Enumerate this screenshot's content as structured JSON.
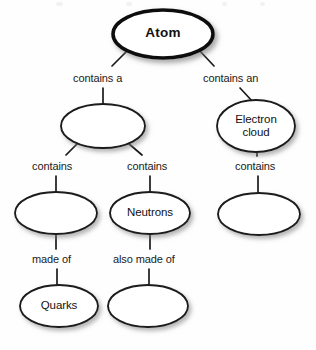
{
  "diagram": {
    "type": "concept-map",
    "title_node": "Atom",
    "background_color": "#fefefe",
    "stroke_color": "#1a1a1a",
    "node_fill": "#ffffff",
    "nodes": [
      {
        "id": "atom",
        "label": "Atom",
        "cx": 163,
        "cy": 34,
        "rx": 50,
        "ry": 24,
        "bold": true,
        "thick": true
      },
      {
        "id": "nucleus",
        "label": "",
        "cx": 103,
        "cy": 126,
        "rx": 42,
        "ry": 22,
        "bold": false,
        "thick": false
      },
      {
        "id": "electroncloud",
        "label": "Electron\ncloud",
        "cx": 256,
        "cy": 126,
        "rx": 39,
        "ry": 26,
        "bold": false,
        "thick": false
      },
      {
        "id": "protons",
        "label": "",
        "cx": 56,
        "cy": 213,
        "rx": 41,
        "ry": 21,
        "bold": false,
        "thick": false
      },
      {
        "id": "neutrons",
        "label": "Neutrons",
        "cx": 150,
        "cy": 213,
        "rx": 40,
        "ry": 21,
        "bold": false,
        "thick": false
      },
      {
        "id": "electrons",
        "label": "",
        "cx": 259,
        "cy": 214,
        "rx": 41,
        "ry": 21,
        "bold": false,
        "thick": false
      },
      {
        "id": "quarks",
        "label": "Quarks",
        "cx": 59,
        "cy": 306,
        "rx": 39,
        "ry": 21,
        "bold": false,
        "thick": false
      },
      {
        "id": "quarks2",
        "label": "",
        "cx": 148,
        "cy": 306,
        "rx": 40,
        "ry": 21,
        "bold": false,
        "thick": false
      }
    ],
    "edges": [
      {
        "id": "atom-nucleus",
        "label": "contains a",
        "label_x": 73,
        "label_y": 72
      },
      {
        "id": "atom-electroncloud",
        "label": "contains an",
        "label_x": 203,
        "label_y": 72
      },
      {
        "id": "nucleus-protons",
        "label": "contains",
        "label_x": 32,
        "label_y": 160
      },
      {
        "id": "nucleus-neutrons",
        "label": "contains",
        "label_x": 127,
        "label_y": 160
      },
      {
        "id": "electroncloud-electrons",
        "label": "contains",
        "label_x": 235,
        "label_y": 160
      },
      {
        "id": "protons-quarks",
        "label": "made of",
        "label_x": 32,
        "label_y": 253
      },
      {
        "id": "neutrons-quarks2",
        "label": "also made of",
        "label_x": 113,
        "label_y": 253
      }
    ]
  }
}
